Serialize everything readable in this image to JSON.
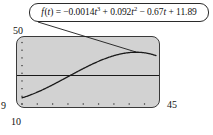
{
  "figure": {
    "name": "cubic-model-graph",
    "background_color": "#ffffff",
    "plot_background_color": "#d2d2d2",
    "line_color": "#1a1a1a"
  },
  "callout": {
    "label": "f (t) = −0.0014t³ + 0.092t² − 0.67t + 11.89",
    "lead_from_x": 38,
    "lead_from_y": 22,
    "lead_to_x": 136,
    "lead_to_y": 52
  },
  "axes": {
    "xmin_label": "10",
    "xmax_label": "45",
    "ymin_label": "9",
    "ymax_label": "50"
  },
  "chart_data": {
    "type": "line",
    "title": "",
    "subtitle": "",
    "xlabel": "",
    "ylabel": "",
    "xlim": [
      10,
      45
    ],
    "ylim": [
      9,
      50
    ],
    "grid": false,
    "legend_position": "none",
    "x_tick_count": 9,
    "y_tick_count": 9,
    "x_ticks": [
      10,
      14,
      18,
      22,
      26,
      30,
      34,
      38,
      42
    ],
    "y_ticks": [
      9,
      14,
      19,
      24,
      29,
      34,
      39,
      44,
      49
    ],
    "annotations": [
      {
        "text": "f (t) = −0.0014t³ + 0.092t² − 0.67t + 11.89",
        "target_x": 36,
        "target_y": 38.5
      }
    ],
    "series": [
      {
        "name": "f(t) = -0.0014t^3 + 0.092t^2 - 0.67t + 11.89",
        "kind": "curve",
        "style": "solid",
        "color": "#1a1a1a",
        "equation": {
          "a3": -0.0014,
          "a2": 0.092,
          "a1": -0.67,
          "a0": 11.89
        },
        "x": [
          10,
          12,
          14,
          16,
          18,
          20,
          22,
          24,
          26,
          28,
          30,
          32,
          34,
          36,
          38,
          40,
          42,
          44,
          45
        ],
        "values": [
          13.99,
          15.66,
          17.52,
          19.52,
          21.62,
          23.77,
          25.93,
          28.05,
          30.09,
          32.0,
          33.74,
          35.26,
          36.52,
          37.47,
          38.07,
          38.27,
          38.03,
          37.31,
          36.76
        ]
      },
      {
        "name": "horizontal reference line",
        "kind": "horizontal-line",
        "style": "solid",
        "color": "#1a1a1a",
        "y_value": 27.5
      }
    ]
  }
}
